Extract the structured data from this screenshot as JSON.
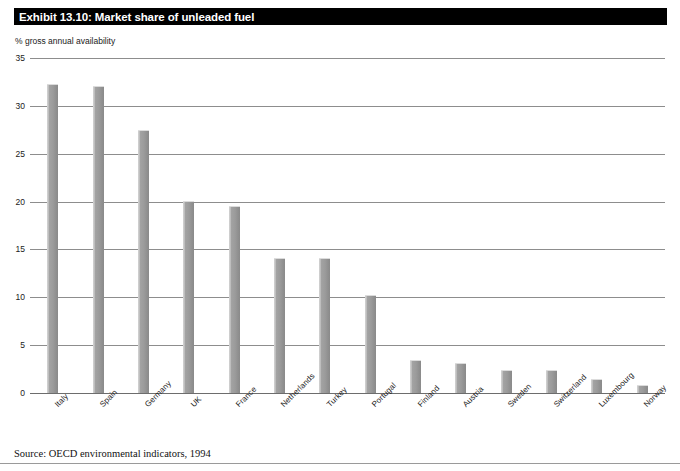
{
  "title": "Exhibit 13.10: Market share of unleaded fuel",
  "axis_caption": "% gross annual availability",
  "side_credit": "Reproduced by permission of the OECD",
  "source": "Source: OECD environmental indicators, 1994",
  "colors": {
    "title_bar": "#000000",
    "title_text": "#ffffff",
    "bar_fill": "#9b9b9b",
    "gridline": "#8d8d8d",
    "background": "#ffffff"
  },
  "chart_data": {
    "type": "bar",
    "title": "Exhibit 13.10: Market share of unleaded fuel",
    "xlabel": "",
    "ylabel": "% gross annual availability",
    "ylim": [
      0,
      35
    ],
    "yticks": [
      0,
      5,
      10,
      15,
      20,
      25,
      30,
      35
    ],
    "ytick_labels": [
      "0",
      "5",
      "10",
      "15",
      "20",
      "25",
      "30",
      "35"
    ],
    "grid": true,
    "legend": false,
    "categories": [
      "Italy",
      "Spain",
      "Germany",
      "UK",
      "France",
      "Netherlands",
      "Turkey",
      "Portugal",
      "Finland",
      "Austria",
      "Sweden",
      "Switzerland",
      "Luxembourg",
      "Norway"
    ],
    "values": [
      32.3,
      32.1,
      27.5,
      20.1,
      19.5,
      14.1,
      14.1,
      10.2,
      3.5,
      3.1,
      2.4,
      2.4,
      1.5,
      0.8
    ],
    "source": "Source: OECD environmental indicators, 1994"
  }
}
